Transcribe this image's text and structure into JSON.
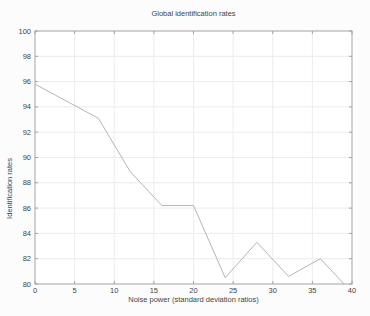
{
  "figure": {
    "background": "#fcfcfc"
  },
  "chart_data": {
    "type": "line",
    "title": "Global identification rates",
    "xlabel": "Noise power (standard deviation ratios)",
    "ylabel": "Identification rates",
    "xlim": [
      0,
      40
    ],
    "ylim": [
      80,
      100
    ],
    "xticks": [
      0,
      5,
      10,
      15,
      20,
      25,
      30,
      35,
      40
    ],
    "yticks": [
      80,
      82,
      84,
      86,
      88,
      90,
      92,
      94,
      96,
      98,
      100
    ],
    "grid": true,
    "legend": "none",
    "series": [
      {
        "name": "global-identification-rate",
        "x": [
          0,
          8,
          12,
          16,
          20,
          24,
          28,
          32,
          36,
          39
        ],
        "y": [
          95.8,
          93.1,
          88.9,
          86.2,
          86.2,
          80.5,
          83.3,
          80.6,
          82.0,
          80.0
        ],
        "color": "#b3b6b3"
      }
    ],
    "colors": {
      "frame": "#a3a3a3",
      "grid": "#ececec",
      "tick": "#a3a3a3",
      "text": "#444444",
      "plot_background": "#ffffff"
    }
  }
}
